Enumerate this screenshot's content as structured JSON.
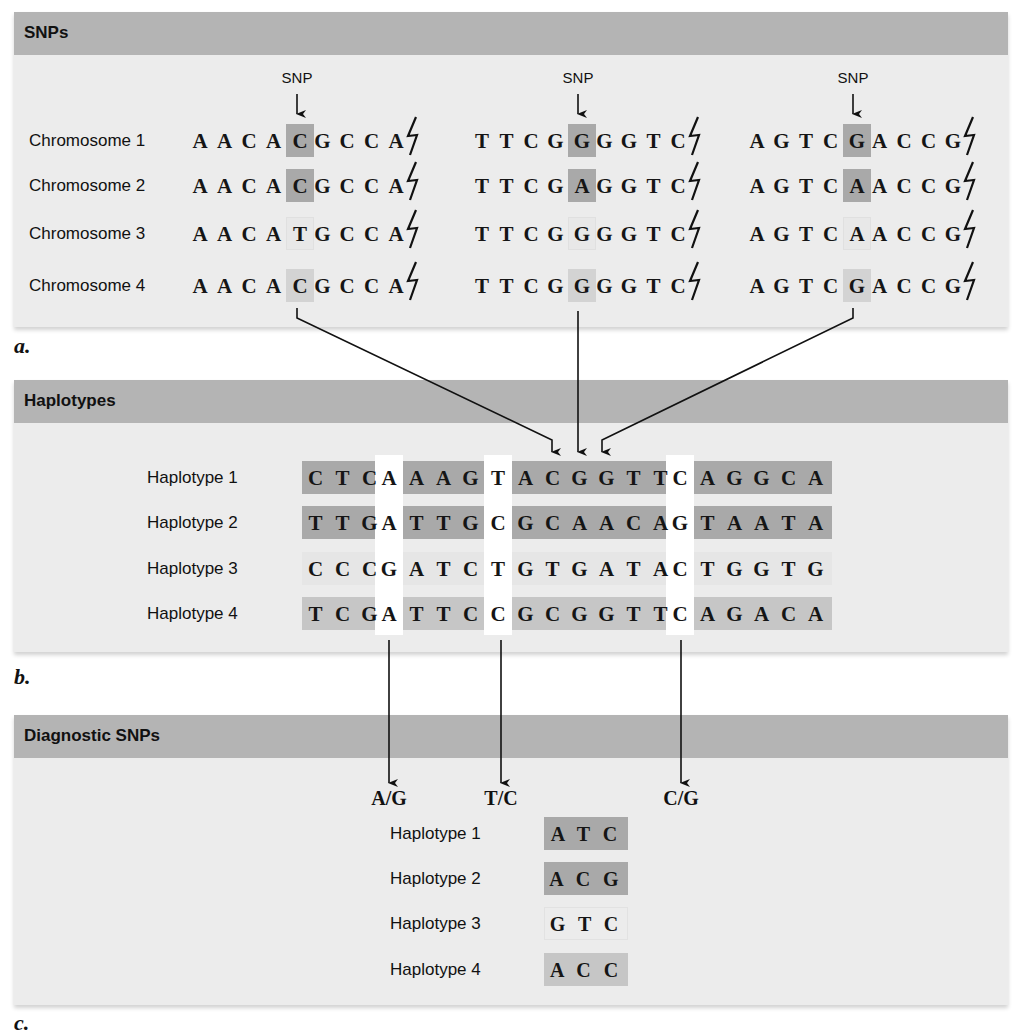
{
  "panels": {
    "snps": {
      "title": "SNPs",
      "label": "a.",
      "snp_marker": "SNP",
      "chromosomes": [
        {
          "label": "Chromosome 1",
          "seg1": "AACACGCCA",
          "seg2": "TTCGGGGTC",
          "seg3": "AGTCGACCG",
          "snps": [
            "C",
            "G",
            "G"
          ]
        },
        {
          "label": "Chromosome 2",
          "seg1": "AACACGCCA",
          "seg2": "TTCGAGGTC",
          "seg3": "AGTCAACCG",
          "snps": [
            "C",
            "A",
            "A"
          ]
        },
        {
          "label": "Chromosome 3",
          "seg1": "AACATGCCA",
          "seg2": "TTCGGGGTC",
          "seg3": "AGTCAACCG",
          "snps": [
            "T",
            "G",
            "A"
          ]
        },
        {
          "label": "Chromosome 4",
          "seg1": "AACACGCCA",
          "seg2": "TTCGGGGTC",
          "seg3": "AGTCGACCG",
          "snps": [
            "C",
            "G",
            "G"
          ]
        }
      ],
      "break_symbol": "⚡"
    },
    "haplotypes": {
      "title": "Haplotypes",
      "label": "b.",
      "rows": [
        {
          "label": "Haplotype 1",
          "sequence": "CTCAAAGTACGGTTCAGGCA"
        },
        {
          "label": "Haplotype 2",
          "sequence": "TTGATTGCGCAACAGTAATA"
        },
        {
          "label": "Haplotype 3",
          "sequence": "CCCGATCTGTGATACTGGTG"
        },
        {
          "label": "Haplotype 4",
          "sequence": "TCGATTCCGCGGTTCAGACA"
        }
      ]
    },
    "diagnostic": {
      "title": "Diagnostic SNPs",
      "label": "c.",
      "alleles": [
        "A/G",
        "T/C",
        "C/G"
      ],
      "rows": [
        {
          "label": "Haplotype 1",
          "snps": "ATC"
        },
        {
          "label": "Haplotype 2",
          "snps": "ACG"
        },
        {
          "label": "Haplotype 3",
          "snps": "GTC"
        },
        {
          "label": "Haplotype 4",
          "snps": "ACC"
        }
      ]
    }
  },
  "colors": {
    "header": "#b4b4b4",
    "panel_bg": "#ececec",
    "shade_dark": "#a9a9a9",
    "shade_light": "#d3d3d3"
  }
}
